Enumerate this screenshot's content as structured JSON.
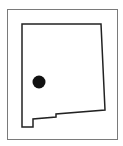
{
  "map": {
    "region": "New Mexico",
    "frame": {
      "x": 7,
      "y": 9,
      "width": 110,
      "height": 130,
      "stroke": "#7a7a7a",
      "stroke_width": 1
    },
    "outline": {
      "stroke": "#222222",
      "stroke_width": 1.5,
      "fill": "#ffffff",
      "points": [
        [
          22,
          24
        ],
        [
          101,
          24
        ],
        [
          105,
          110
        ],
        [
          56,
          114
        ],
        [
          56,
          117
        ],
        [
          33,
          119
        ],
        [
          33,
          127
        ],
        [
          22,
          127
        ]
      ]
    },
    "marker": {
      "cx": 39,
      "cy": 82,
      "r": 6.5,
      "color": "#111111"
    }
  }
}
